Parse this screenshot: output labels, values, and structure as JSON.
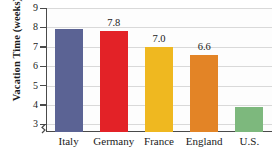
{
  "chart_data": {
    "type": "bar",
    "title": "",
    "xlabel": "",
    "ylabel": "Vacation Time (weeks)",
    "categories": [
      "Italy",
      "Germany",
      "France",
      "England",
      "U.S."
    ],
    "values": [
      7.9,
      7.8,
      7.0,
      6.6,
      3.9
    ],
    "data_labels": [
      "",
      "7.8",
      "7.0",
      "6.6",
      ""
    ],
    "colors": [
      "#5B6394",
      "#E32227",
      "#EFB820",
      "#E38426",
      "#7DB87D"
    ],
    "ylim": [
      2.6,
      9
    ],
    "yticks": [
      9,
      8,
      7,
      6,
      5,
      4,
      3
    ],
    "ytick_labels": [
      "9",
      "8",
      "7",
      "6",
      "5",
      "4",
      "3"
    ],
    "grid": true,
    "axis_break": true,
    "legend": "none"
  },
  "axis": {
    "y_title": "Vacation Time (weeks)"
  },
  "colors": {
    "axis": "#4a4a4a",
    "grid": "#d9d9d9",
    "text": "#1a1a1a",
    "plot_background": "#fdfdfd"
  }
}
